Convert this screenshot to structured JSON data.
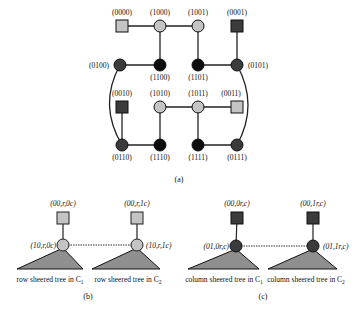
{
  "colors": {
    "light": "#c4c4c4",
    "dark": "#3b3b3b",
    "black": "#0d0d0d",
    "edge": "#222222",
    "triangle": "#8f8f8f"
  },
  "part_a": {
    "caption": "(a)",
    "nodes": [
      {
        "id": "0000",
        "label": "(0000)",
        "shape": "square",
        "fill": "light",
        "x": 122,
        "y": 26,
        "lx": 122,
        "ly": 15,
        "anchor": "middle"
      },
      {
        "id": "1000",
        "label": "(1000)",
        "shape": "circle",
        "fill": "light",
        "x": 160,
        "y": 26,
        "lx": 160,
        "ly": 15,
        "anchor": "middle"
      },
      {
        "id": "1001",
        "label": "(1001)",
        "shape": "circle",
        "fill": "light",
        "x": 198,
        "y": 26,
        "lx": 198,
        "ly": 15,
        "anchor": "middle"
      },
      {
        "id": "0001",
        "label": "(0001)",
        "shape": "square",
        "fill": "dark",
        "x": 237,
        "y": 26,
        "lx": 237,
        "ly": 15,
        "anchor": "middle"
      },
      {
        "id": "0100",
        "label": "(0100)",
        "shape": "circle",
        "fill": "dark",
        "x": 120,
        "y": 65,
        "lx": 109,
        "ly": 68,
        "anchor": "end"
      },
      {
        "id": "1100",
        "label": "(1100)",
        "shape": "circle",
        "fill": "black",
        "x": 160,
        "y": 65,
        "lx": 160,
        "ly": 80,
        "anchor": "middle"
      },
      {
        "id": "1101",
        "label": "(1101)",
        "shape": "circle",
        "fill": "black",
        "x": 198,
        "y": 65,
        "lx": 198,
        "ly": 80,
        "anchor": "middle"
      },
      {
        "id": "0101",
        "label": "(0101)",
        "shape": "circle",
        "fill": "dark",
        "x": 237,
        "y": 65,
        "lx": 248,
        "ly": 68,
        "anchor": "start"
      },
      {
        "id": "0010",
        "label": "(0010)",
        "shape": "square",
        "fill": "dark",
        "x": 122,
        "y": 107,
        "lx": 122,
        "ly": 96,
        "anchor": "middle"
      },
      {
        "id": "1010",
        "label": "(1010)",
        "shape": "circle",
        "fill": "light",
        "x": 160,
        "y": 107,
        "lx": 160,
        "ly": 96,
        "anchor": "middle"
      },
      {
        "id": "1011",
        "label": "(1011)",
        "shape": "circle",
        "fill": "light",
        "x": 198,
        "y": 107,
        "lx": 198,
        "ly": 96,
        "anchor": "middle"
      },
      {
        "id": "0011",
        "label": "(0011)",
        "shape": "square",
        "fill": "light",
        "x": 237,
        "y": 107,
        "lx": 231,
        "ly": 96,
        "anchor": "middle"
      },
      {
        "id": "0110",
        "label": "(0110)",
        "shape": "circle",
        "fill": "dark",
        "x": 122,
        "y": 145,
        "lx": 122,
        "ly": 160,
        "anchor": "middle"
      },
      {
        "id": "1110",
        "label": "(1110)",
        "shape": "circle",
        "fill": "black",
        "x": 160,
        "y": 145,
        "lx": 160,
        "ly": 160,
        "anchor": "middle"
      },
      {
        "id": "1111",
        "label": "(1111)",
        "shape": "circle",
        "fill": "black",
        "x": 198,
        "y": 145,
        "lx": 198,
        "ly": 160,
        "anchor": "middle"
      },
      {
        "id": "0111",
        "label": "(0111)",
        "shape": "circle",
        "fill": "dark",
        "x": 237,
        "y": 145,
        "lx": 237,
        "ly": 160,
        "anchor": "middle"
      }
    ],
    "edges": [
      [
        "0000",
        "1000"
      ],
      [
        "1000",
        "1001"
      ],
      [
        "1000",
        "1100"
      ],
      [
        "1001",
        "1101"
      ],
      [
        "0001",
        "0101"
      ],
      [
        "0100",
        "1100"
      ],
      [
        "1101",
        "0101"
      ],
      [
        "1010",
        "1011"
      ],
      [
        "1011",
        "0011"
      ],
      [
        "0010",
        "0110"
      ],
      [
        "1010",
        "1110"
      ],
      [
        "1011",
        "1111"
      ],
      [
        "0110",
        "1110"
      ],
      [
        "1111",
        "0111"
      ]
    ],
    "arcs": [
      {
        "from": "0100",
        "to": "0110",
        "side": "left"
      },
      {
        "from": "0101",
        "to": "0111",
        "side": "right"
      }
    ]
  },
  "part_b": {
    "caption": "(b)",
    "trees": [
      {
        "top_label": "(00,r,0c)",
        "root_label": "(10,r,0c)",
        "tree_label": "row sheered tree in C",
        "tree_sub": "1"
      },
      {
        "top_label": "(00,r,1c)",
        "root_label": "(10,r,1c)",
        "tree_label": "row sheered tree in C",
        "tree_sub": "2"
      }
    ]
  },
  "part_c": {
    "caption": "(c)",
    "trees": [
      {
        "top_label": "(00,0r,c)",
        "root_label": "(01,0r,c)",
        "tree_label": "column sheered tree in C",
        "tree_sub": "1"
      },
      {
        "top_label": "(00,1r,c)",
        "root_label": "(01,1r,c)",
        "tree_label": "column sheered tree in C",
        "tree_sub": "2"
      }
    ]
  }
}
